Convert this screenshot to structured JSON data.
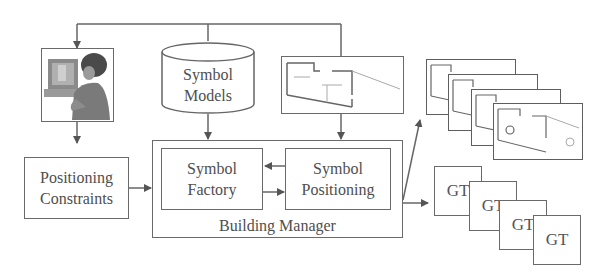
{
  "diagram": {
    "nodes": {
      "user": {
        "icon": "user-at-computer-icon"
      },
      "symbol_models": {
        "line1": "Symbol",
        "line2": "Models",
        "shape": "cylinder"
      },
      "floor_plan": {
        "icon": "floor-plan-icon"
      },
      "positioning_constraints": {
        "line1": "Positioning",
        "line2": "Constraints"
      },
      "building_manager": {
        "label": "Building Manager"
      },
      "symbol_factory": {
        "line1": "Symbol",
        "line2": "Factory"
      },
      "symbol_positioning": {
        "line1": "Symbol",
        "line2": "Positioning"
      },
      "output_plans": {
        "count": 4,
        "icon": "floor-plan-icon"
      },
      "ground_truth": {
        "labels": [
          "GT",
          "GT",
          "GT",
          "GT"
        ]
      }
    },
    "edges": [
      {
        "from": "top-bus",
        "to": "user"
      },
      {
        "from": "top-bus",
        "to": "symbol_models"
      },
      {
        "from": "top-bus",
        "to": "floor_plan"
      },
      {
        "from": "user",
        "to": "positioning_constraints"
      },
      {
        "from": "positioning_constraints",
        "to": "building_manager"
      },
      {
        "from": "symbol_models",
        "to": "building_manager"
      },
      {
        "from": "floor_plan",
        "to": "building_manager"
      },
      {
        "from": "symbol_positioning",
        "to": "symbol_factory"
      },
      {
        "from": "symbol_factory",
        "to": "symbol_positioning"
      },
      {
        "from": "building_manager",
        "to": "output_plans"
      },
      {
        "from": "building_manager",
        "to": "ground_truth"
      }
    ]
  }
}
